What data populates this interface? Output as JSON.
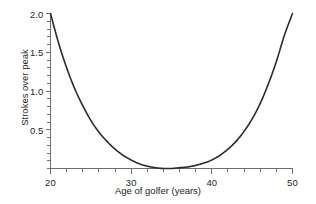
{
  "chart_data": {
    "type": "line",
    "title": "",
    "subtitle": "",
    "xlabel": "Age of golfer (years)",
    "ylabel": "Strokes over peak",
    "xlim": [
      20,
      50
    ],
    "ylim": [
      0,
      2.0
    ],
    "grid": false,
    "legend": null,
    "legend_position": "none",
    "annotations": [],
    "x_major_ticks": [
      20,
      30,
      40,
      50
    ],
    "x_major_tick_labels": [
      "20",
      "30",
      "40",
      "50"
    ],
    "x_minor_tick_step": 2,
    "y_major_ticks": [
      0.5,
      1.0,
      1.5,
      2.0
    ],
    "y_major_tick_labels": [
      "0.5",
      "1.0",
      "1.5",
      "2.0"
    ],
    "y_minor_tick_step": 0.1,
    "series": [
      {
        "name": "strokes over peak",
        "color": "#2b2b2b",
        "line_width": 1.6,
        "x": [
          20,
          21,
          22,
          23,
          24,
          25,
          26,
          27,
          28,
          29,
          30,
          31,
          32,
          33,
          34,
          35,
          36,
          37,
          38,
          39,
          40,
          41,
          42,
          43,
          44,
          45,
          46,
          47,
          48,
          49,
          50
        ],
        "values": [
          2.0,
          1.62,
          1.3,
          1.03,
          0.81,
          0.62,
          0.47,
          0.35,
          0.25,
          0.17,
          0.11,
          0.06,
          0.03,
          0.01,
          0.0,
          0.0,
          0.01,
          0.02,
          0.04,
          0.07,
          0.11,
          0.17,
          0.25,
          0.35,
          0.48,
          0.64,
          0.84,
          1.09,
          1.38,
          1.72,
          2.0
        ]
      }
    ]
  },
  "axes": {
    "spine_color": "#6d6e71",
    "tick_color": "#6d6e71",
    "background": "#ffffff"
  }
}
